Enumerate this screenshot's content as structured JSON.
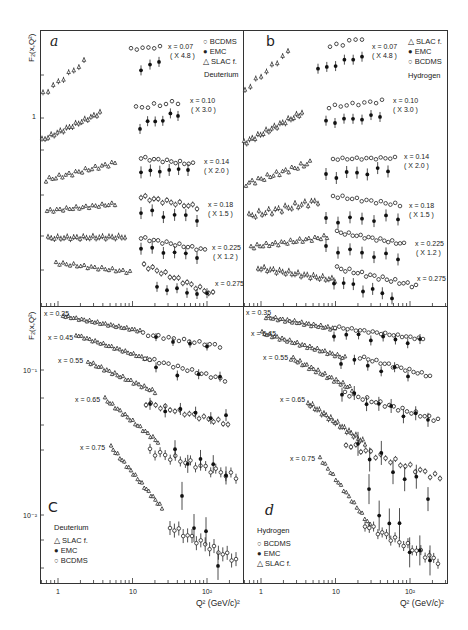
{
  "figure": {
    "panels": {
      "a": {
        "letter": "a",
        "target": "Deuterium"
      },
      "b": {
        "letter": "b",
        "target": "Hydrogen"
      },
      "c": {
        "letter": "C",
        "target": "Deuterium"
      },
      "d": {
        "letter": "d",
        "target": "Hydrogen"
      }
    },
    "ylabel_top": "F₂(x,Q²)",
    "ylabel_bottom": "F₂(x,Q²)",
    "xlabel": "Q² (GeV/c)²",
    "x_ticks": [
      "1",
      "10",
      "10²"
    ],
    "y_tick_top": "1",
    "y_ticks_bottom": [
      "10⁻¹",
      "10⁻²"
    ],
    "legend_a": [
      "BCDMS",
      "EMC",
      "SLAC f."
    ],
    "legend_b": [
      "SLAC f.",
      "EMC",
      "BCDMS"
    ],
    "legend_c": [
      "SLAC f.",
      "EMC",
      "BCDMS"
    ],
    "legend_d": [
      "BCDMS",
      "EMC",
      "SLAC f."
    ],
    "top_labels": [
      {
        "x": "x = 0.07",
        "scale": "( X 4.8 )"
      },
      {
        "x": "x = 0.10",
        "scale": "( X 3.0 )"
      },
      {
        "x": "x = 0.14",
        "scale": "( X 2.0 )"
      },
      {
        "x": "x = 0.18",
        "scale": "( X 1.5 )"
      },
      {
        "x": "x = 0.225",
        "scale": "( X 1.2 )"
      },
      {
        "x": "x = 0.275",
        "scale": ""
      }
    ],
    "bottom_labels": [
      "x = 0.35",
      "x = 0.45",
      "x = 0.55",
      "x = 0.65",
      "x = 0.75"
    ]
  },
  "chart_data": [
    {
      "type": "scatter",
      "title": "a — Deuterium, F2 vs Q2 (small x, scaled)",
      "xlabel": "Q² (GeV/c)²",
      "ylabel": "F₂(x,Q²)",
      "xscale": "log",
      "yscale": "log",
      "xlim": [
        0.6,
        250
      ],
      "legend": [
        "BCDMS",
        "EMC",
        "SLAC f."
      ],
      "series": [
        {
          "name": "x=0.07 (x4.8)",
          "SLAC": [
            [
              0.6,
              1.6
            ],
            [
              1.0,
              1.95
            ],
            [
              1.5,
              2.05
            ],
            [
              2.0,
              2.15
            ],
            [
              3.0,
              2.25
            ]
          ],
          "BCDMS": [
            [
              15,
              2.7
            ],
            [
              17,
              2.7
            ],
            [
              25,
              2.8
            ],
            [
              27,
              2.75
            ]
          ],
          "EMC": [
            [
              17,
              2.0
            ],
            [
              22,
              2.25
            ],
            [
              27,
              2.25
            ]
          ]
        },
        {
          "name": "x=0.10 (x3.0)",
          "SLAC": [
            [
              0.6,
              0.78
            ],
            [
              1.0,
              0.82
            ],
            [
              2.0,
              0.9
            ],
            [
              4,
              0.97
            ],
            [
              6,
              1.02
            ]
          ],
          "BCDMS": [
            [
              17,
              1.22
            ],
            [
              20,
              1.23
            ],
            [
              30,
              1.23
            ],
            [
              40,
              1.25
            ],
            [
              60,
              1.3
            ]
          ],
          "EMC": [
            [
              17,
              0.92
            ],
            [
              25,
              0.98
            ],
            [
              30,
              0.95
            ],
            [
              50,
              1.02
            ],
            [
              70,
              1.03
            ]
          ]
        },
        {
          "name": "x=0.14 (x2.0)",
          "SLAC": [
            [
              0.7,
              0.7
            ],
            [
              1,
              0.72
            ],
            [
              2,
              0.76
            ],
            [
              4,
              0.8
            ],
            [
              8,
              0.8
            ]
          ],
          "BCDMS": [
            [
              17,
              0.85
            ],
            [
              25,
              0.86
            ],
            [
              40,
              0.84
            ],
            [
              80,
              0.84
            ]
          ],
          "EMC": [
            [
              17,
              0.72
            ],
            [
              25,
              0.72
            ],
            [
              40,
              0.72
            ],
            [
              80,
              0.73
            ]
          ]
        },
        {
          "name": "x=0.18 (x1.5)",
          "SLAC": [
            [
              0.7,
              0.56
            ],
            [
              1,
              0.58
            ],
            [
              3,
              0.6
            ],
            [
              6,
              0.6
            ]
          ],
          "BCDMS": [
            [
              17,
              0.64
            ],
            [
              25,
              0.62
            ],
            [
              40,
              0.6
            ],
            [
              100,
              0.58
            ]
          ],
          "EMC": [
            [
              17,
              0.56
            ],
            [
              25,
              0.55
            ],
            [
              50,
              0.53
            ],
            [
              100,
              0.5
            ]
          ]
        },
        {
          "name": "x=0.225 (x1.2)",
          "SLAC": [
            [
              0.7,
              0.46
            ],
            [
              1,
              0.47
            ],
            [
              3,
              0.48
            ],
            [
              8,
              0.47
            ]
          ],
          "BCDMS": [
            [
              17,
              0.48
            ],
            [
              30,
              0.46
            ],
            [
              60,
              0.44
            ],
            [
              150,
              0.42
            ]
          ],
          "EMC": [
            [
              17,
              0.42
            ],
            [
              30,
              0.42
            ],
            [
              60,
              0.41
            ],
            [
              100,
              0.4
            ]
          ]
        },
        {
          "name": "x=0.275",
          "SLAC": [
            [
              1,
              0.36
            ],
            [
              2,
              0.37
            ],
            [
              4,
              0.36
            ],
            [
              10,
              0.35
            ]
          ],
          "BCDMS": [
            [
              18,
              0.34
            ],
            [
              30,
              0.32
            ],
            [
              60,
              0.31
            ],
            [
              150,
              0.29
            ]
          ],
          "EMC": [
            [
              25,
              0.28
            ],
            [
              40,
              0.29
            ],
            [
              80,
              0.28
            ],
            [
              140,
              0.27
            ]
          ]
        }
      ]
    },
    {
      "type": "scatter",
      "title": "b — Hydrogen, F2 vs Q2 (small x, scaled)",
      "xscale": "log",
      "yscale": "log",
      "xlim": [
        0.6,
        250
      ],
      "legend": [
        "SLAC f.",
        "EMC",
        "BCDMS"
      ],
      "series": [
        {
          "name": "x=0.07 (x4.8)",
          "SLAC": [
            [
              0.6,
              1.5
            ],
            [
              1,
              1.75
            ],
            [
              2,
              1.9
            ],
            [
              3,
              2.05
            ]
          ]
        },
        {
          "name": "x=0.10 (x3.0)"
        },
        {
          "name": "x=0.14 (x2.0)"
        },
        {
          "name": "x=0.18 (x1.5)"
        },
        {
          "name": "x=0.225 (x1.2)"
        },
        {
          "name": "x=0.275"
        }
      ]
    },
    {
      "type": "scatter",
      "title": "c — Deuterium, F2 vs Q2 (large x)",
      "xscale": "log",
      "yscale": "log",
      "xlim": [
        0.6,
        250
      ],
      "y_ticks": [
        "10^-1",
        "10^-2"
      ],
      "legend": [
        "SLAC f.",
        "EMC",
        "BCDMS"
      ],
      "series": [
        {
          "name": "x=0.35"
        },
        {
          "name": "x=0.45"
        },
        {
          "name": "x=0.55"
        },
        {
          "name": "x=0.65"
        },
        {
          "name": "x=0.75"
        }
      ]
    },
    {
      "type": "scatter",
      "title": "d — Hydrogen, F2 vs Q2 (large x)",
      "xscale": "log",
      "yscale": "log",
      "xlim": [
        0.6,
        250
      ],
      "legend": [
        "BCDMS",
        "EMC",
        "SLAC f."
      ],
      "series": [
        {
          "name": "x=0.35"
        },
        {
          "name": "x=0.45"
        },
        {
          "name": "x=0.55"
        },
        {
          "name": "x=0.65"
        },
        {
          "name": "x=0.75"
        }
      ]
    }
  ]
}
